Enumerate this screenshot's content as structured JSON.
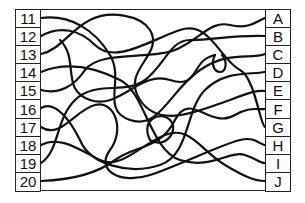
{
  "puzzle": {
    "type": "tangled-lines-matching",
    "left_labels": [
      "11",
      "12",
      "13",
      "14",
      "15",
      "16",
      "17",
      "18",
      "19",
      "20"
    ],
    "right_labels": [
      "A",
      "B",
      "C",
      "D",
      "E",
      "F",
      "G",
      "H",
      "I",
      "J"
    ],
    "line_color": "#111111",
    "border_color": "#222222",
    "background_color": "#ffffff"
  }
}
